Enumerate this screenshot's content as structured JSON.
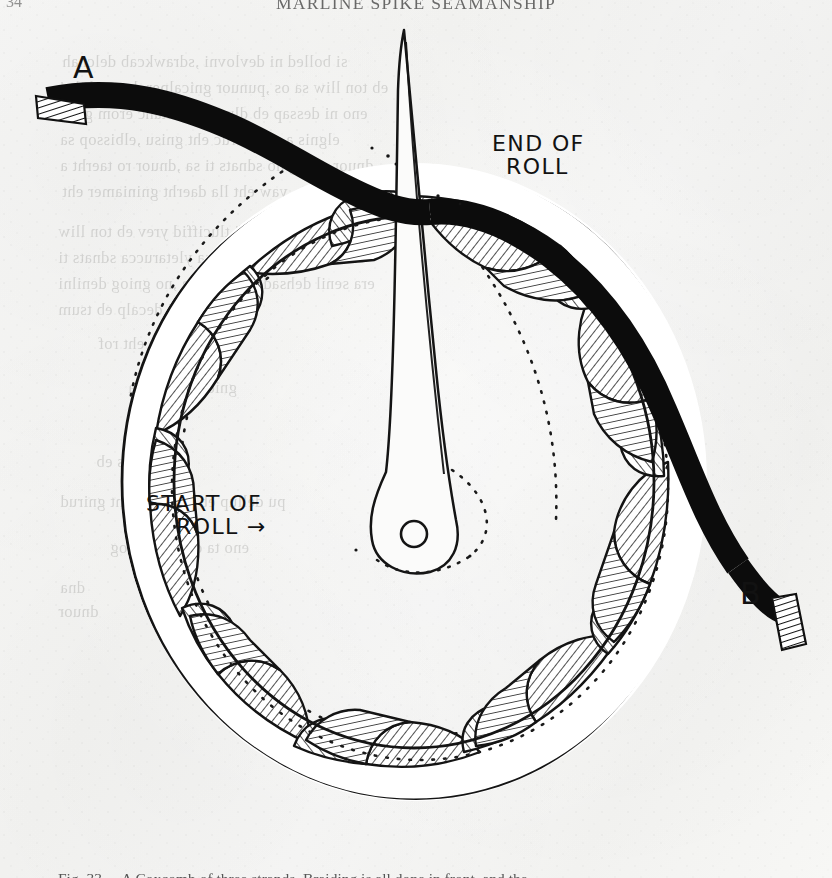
{
  "page": {
    "running_head": "MARLINE SPIKE SEAMANSHIP",
    "folio": "34",
    "background_color": "#f7f7f6",
    "ink_color": "#111111"
  },
  "figure": {
    "caption": "Fig. 33.—A Coxcomb of three strands. Braiding is all done in front, and the",
    "labels": {
      "end_of_roll_line1": "END OF",
      "end_of_roll_line2": "ROLL",
      "start_of_roll_line1": "START OF",
      "start_of_roll_line2": "ROLL →",
      "rope_end_a": "A",
      "rope_end_b": "B"
    },
    "elements": [
      {
        "name": "braided-ring",
        "description": "Circular coxcomb braid of three strands, hatched line shading"
      },
      {
        "name": "fid",
        "description": "Long tapered sail-needle / fid drawn in outline, pointing up-right"
      },
      {
        "name": "needle-eye",
        "description": "Small circle at lower end of fid marking start of roll"
      },
      {
        "name": "rope-a",
        "description": "Solid black rope entering from upper left, whipped end labelled A"
      },
      {
        "name": "rope-b",
        "description": "Solid black rope exiting lower right, whipped end labelled B"
      },
      {
        "name": "dotted-guides",
        "description": "Dotted construction outlines showing prior lay of the braid"
      }
    ]
  },
  "bleed_through": [
    {
      "text": "si bolled ni devlovni ,sdrawkcab delcnah",
      "x": 62,
      "y": 52,
      "size": 16.5
    },
    {
      "text": "eb ton lliw sa os ,punuor gnicalper dna ,sekil s'",
      "x": 60,
      "y": 78,
      "size": 16.5
    },
    {
      "text": "eno ni dessap eb dluow ,sgnitahc erom gnol",
      "x": 62,
      "y": 104,
      "size": 16.5
    },
    {
      "text": "elgnis a ni tnerruc eht gnisu ,elbissop sa",
      "x": 60,
      "y": 130,
      "size": 16.5
    },
    {
      "text": "dnuor gniog no sdnats ti sa ,dnuor ro taerht a",
      "x": 60,
      "y": 156,
      "size": 16.5
    },
    {
      "text": "yaw eht lla daerht gniniamer eht",
      "x": 62,
      "y": 182,
      "size": 16.5
    },
    {
      "text": "ees eht hsiw uoy fi tluciffid yrev eb ton lliw",
      "x": 58,
      "y": 222,
      "size": 16.5
    },
    {
      "text": "esiw eht ,gnikam si ti sa yletarucca sdnats ti",
      "x": 58,
      "y": 248,
      "size": 16.5
    },
    {
      "text": "era senil dehsad yb dewolla ,no gniog denilni",
      "x": 58,
      "y": 274,
      "size": 16.5
    },
    {
      "text": "eht ni decalp eb tsum",
      "x": 58,
      "y": 300,
      "size": 16.5
    },
    {
      "text": "gnitahc eht rof",
      "x": 98,
      "y": 334,
      "size": 16.5
    },
    {
      "text": "gnidnats si ti sa",
      "x": 128,
      "y": 378,
      "size": 16.5
    },
    {
      "text": "detrats eb",
      "x": 96,
      "y": 452,
      "size": 16.5
    },
    {
      "text": "pu dellup eb nac raey eht gnirud",
      "x": 60,
      "y": 492,
      "size": 16.5
    },
    {
      "text": "eno ta dnuora gniog",
      "x": 110,
      "y": 538,
      "size": 16.5
    },
    {
      "text": "dna",
      "x": 60,
      "y": 578,
      "size": 16.5
    },
    {
      "text": "dnuor",
      "x": 58,
      "y": 602,
      "size": 16.5
    }
  ]
}
